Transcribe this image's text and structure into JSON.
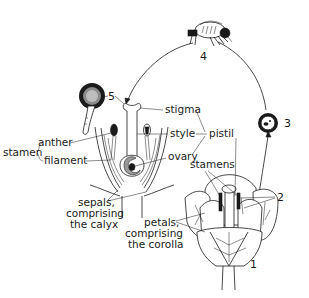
{
  "figure": {
    "step_numbers": [
      "1",
      "2",
      "3",
      "4",
      "5"
    ],
    "labels": {
      "stigma": "stigma",
      "style": "style",
      "pistil": "pistil",
      "ovary": "ovary",
      "anther": "anther",
      "filament": "filament",
      "stamen": "stamen",
      "stamens": "stamens",
      "sepals_line1": "sepals,",
      "sepals_line2": "comprising",
      "sepals_line3": "the calyx",
      "petals_line1": "petals,",
      "petals_line2": "comprising",
      "petals_line3": "the corolla"
    },
    "colors": {
      "ink": "#1a1a1a",
      "background": "#ffffff"
    }
  }
}
